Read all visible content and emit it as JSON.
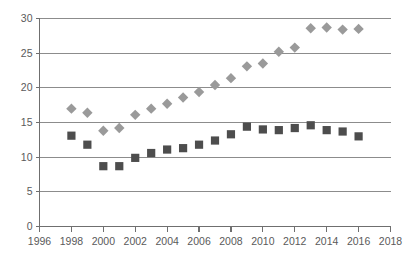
{
  "chart_data": {
    "type": "scatter",
    "title": "",
    "subtitle": "",
    "xlabel": "",
    "ylabel": "",
    "xlim": [
      1996,
      2018
    ],
    "ylim": [
      0,
      30
    ],
    "xticks": [
      1996,
      1998,
      2000,
      2002,
      2004,
      2006,
      2008,
      2010,
      2012,
      2014,
      2016,
      2018
    ],
    "yticks": [
      0,
      5,
      10,
      15,
      20,
      25,
      30
    ],
    "xtick_labels": [
      "1996",
      "1998",
      "2000",
      "2002",
      "2004",
      "2006",
      "2008",
      "2010",
      "2012",
      "2014",
      "2016",
      "2018"
    ],
    "ytick_labels": [
      "0",
      "5",
      "10",
      "15",
      "20",
      "25",
      "30"
    ],
    "grid": "horizontal",
    "legend": "none",
    "x": [
      1998,
      1999,
      2000,
      2001,
      2002,
      2003,
      2004,
      2005,
      2006,
      2007,
      2008,
      2009,
      2010,
      2011,
      2012,
      2013,
      2014,
      2015,
      2016
    ],
    "series": [
      {
        "name": "diamond-series",
        "marker": "diamond",
        "color": "#9a9a9a",
        "values": [
          17.0,
          16.4,
          13.8,
          14.2,
          16.1,
          17.0,
          17.7,
          18.6,
          19.4,
          20.4,
          21.4,
          23.1,
          23.5,
          25.2,
          25.8,
          28.6,
          28.7,
          28.4,
          28.5
        ]
      },
      {
        "name": "square-series",
        "marker": "square",
        "color": "#4d4d4d",
        "values": [
          13.1,
          11.8,
          8.7,
          8.7,
          9.9,
          10.6,
          11.1,
          11.3,
          11.8,
          12.4,
          13.3,
          14.4,
          14.0,
          13.9,
          14.2,
          14.6,
          13.9,
          13.7,
          13.0
        ]
      }
    ]
  },
  "colors": {
    "gridline": "#8c8c8c",
    "axis": "#6f6f6f",
    "tick_label": "#5a5a5a",
    "background": "#ffffff"
  }
}
